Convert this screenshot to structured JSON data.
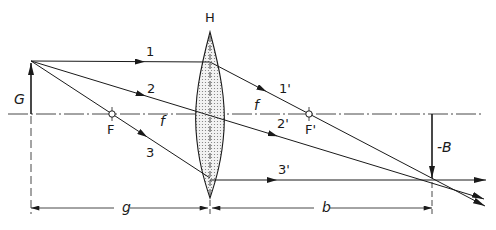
{
  "diagram": {
    "type": "optics-ray-diagram",
    "labels": {
      "lens": "H",
      "object": "G",
      "image": "-B",
      "focal_point_object": "F",
      "focal_point_image": "F'",
      "focal_length_left": "f",
      "focal_length_right": "f",
      "object_distance": "g",
      "image_distance": "b",
      "ray1_in": "1",
      "ray2_in": "2",
      "ray3_in": "3",
      "ray1_out": "1'",
      "ray2_out": "2'",
      "ray3_out": "3'"
    },
    "rays": [
      {
        "id": "1",
        "description": "parallel ray, refracted through F'"
      },
      {
        "id": "2",
        "description": "central ray, passes through lens center undeviated"
      },
      {
        "id": "3",
        "description": "focal ray through F, exits parallel to axis"
      }
    ],
    "colors": {
      "line": "#1a1a1a",
      "lens_fill": "#d8d8d8",
      "background": "#ffffff"
    }
  }
}
